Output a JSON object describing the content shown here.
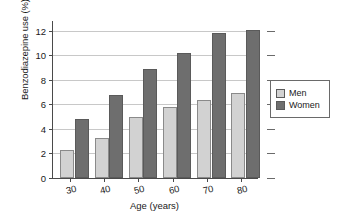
{
  "chart_data": {
    "type": "bar",
    "title": "",
    "subtitle": "",
    "xlabel": "Age (years)",
    "ylabel": "Benzodiazepine use (%)",
    "categories": [
      "30",
      "40",
      "50",
      "60",
      "70",
      "80"
    ],
    "series": [
      {
        "name": "Men",
        "color": "#d2d2d2",
        "values": [
          2.3,
          3.3,
          5.0,
          5.8,
          6.4,
          6.9
        ]
      },
      {
        "name": "Women",
        "color": "#6e6e6e",
        "values": [
          4.8,
          6.8,
          8.9,
          10.2,
          11.8,
          12.1
        ]
      }
    ],
    "ylim": [
      0,
      12.8
    ],
    "yticks": [
      0,
      2,
      4,
      6,
      8,
      10,
      12
    ],
    "ytick_labels": [
      "0",
      "2",
      "4",
      "6",
      "8",
      "10",
      "12"
    ],
    "grid": true,
    "grid_axis": "y",
    "legend_position": "right",
    "legend_entries": [
      "Men",
      "Women"
    ]
  },
  "legend": {
    "items": [
      {
        "label": "Men",
        "swatch": "legend-swatch-men"
      },
      {
        "label": "Women",
        "swatch": "legend-swatch-women"
      }
    ]
  }
}
